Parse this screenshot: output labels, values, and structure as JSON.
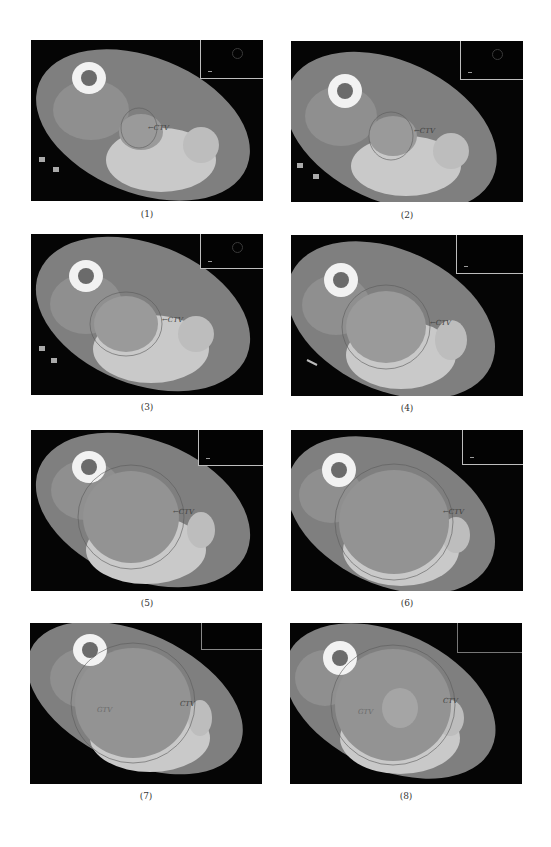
{
  "figure": {
    "panels": [
      {
        "id": 1,
        "caption": "(1)",
        "annotation": "←CTV",
        "ctv": {
          "cx": 108,
          "cy": 88,
          "rx": 18,
          "ry": 20
        }
      },
      {
        "id": 2,
        "caption": "(2)",
        "annotation": "←CTV",
        "ctv": {
          "cx": 100,
          "cy": 95,
          "rx": 22,
          "ry": 24
        }
      },
      {
        "id": 3,
        "caption": "(3)",
        "annotation": "←CTV",
        "ctv": {
          "cx": 95,
          "cy": 90,
          "rx": 36,
          "ry": 32
        }
      },
      {
        "id": 4,
        "caption": "(4)",
        "annotation": "←CTV",
        "ctv": {
          "cx": 95,
          "cy": 92,
          "rx": 44,
          "ry": 42
        }
      },
      {
        "id": 5,
        "caption": "(5)",
        "annotation": "←CTV",
        "ctv": {
          "cx": 100,
          "cy": 87,
          "rx": 53,
          "ry": 52
        }
      },
      {
        "id": 6,
        "caption": "(6)",
        "annotation": "←CTV",
        "ctv": {
          "cx": 103,
          "cy": 92,
          "rx": 59,
          "ry": 58
        }
      },
      {
        "id": 7,
        "caption": "(7)",
        "annotation": "CTV",
        "secondary_annotation": "GTV",
        "ctv": {
          "cx": 103,
          "cy": 80,
          "rx": 62,
          "ry": 60
        }
      },
      {
        "id": 8,
        "caption": "(8)",
        "annotation": "CTV",
        "secondary_annotation": "GTV",
        "ctv": {
          "cx": 103,
          "cy": 80,
          "rx": 62,
          "ry": 60
        }
      }
    ]
  }
}
